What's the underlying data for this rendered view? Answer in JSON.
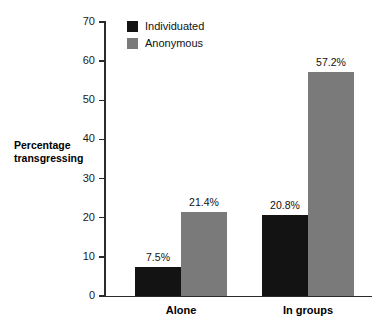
{
  "chart_data": {
    "type": "bar",
    "title": "",
    "subtitle": "",
    "xlabel": "",
    "ylabel": "Percentage transgressing",
    "ylabel_line1": "Percentage",
    "ylabel_line2": "transgressing",
    "categories": [
      "Alone",
      "In groups"
    ],
    "series": [
      {
        "name": "Individuated",
        "color": "#131313",
        "values": [
          7.5,
          20.8
        ],
        "labels": [
          "7.5%",
          "20.8%"
        ]
      },
      {
        "name": "Anonymous",
        "color": "#7a7a7a",
        "values": [
          21.4,
          57.2
        ],
        "labels": [
          "21.4%",
          "57.2%"
        ]
      }
    ],
    "ylim": [
      0,
      70
    ],
    "yticks": [
      0,
      10,
      20,
      30,
      40,
      50,
      60,
      70
    ],
    "ytick_labels": [
      "0",
      "10",
      "20",
      "30",
      "40",
      "50",
      "60",
      "70"
    ],
    "grid": false,
    "legend_position": "top-left-inside",
    "axis_color": "#2b2b2b",
    "background": "#ffffff"
  },
  "legend": {
    "items": [
      {
        "label": "Individuated",
        "color": "#131313"
      },
      {
        "label": "Anonymous",
        "color": "#7a7a7a"
      }
    ]
  }
}
